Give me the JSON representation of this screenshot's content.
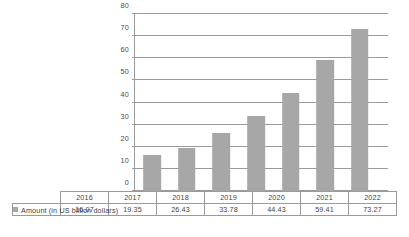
{
  "chart_data": {
    "type": "bar",
    "title": "",
    "subtitle": "",
    "xlabel": "",
    "ylabel": "",
    "categories": [
      "2016",
      "2017",
      "2018",
      "2019",
      "2020",
      "2021",
      "2022"
    ],
    "series": [
      {
        "name": "Amount (in US billion dollars)",
        "values": [
          16.07,
          19.35,
          26.43,
          33.78,
          44.43,
          59.41,
          73.27
        ]
      }
    ],
    "value_labels": [
      "16.07",
      "19.35",
      "26.43",
      "33.78",
      "44.43",
      "59.41",
      "73.27"
    ],
    "ylim": [
      0,
      80
    ],
    "yticks": [
      0,
      10,
      20,
      30,
      40,
      50,
      60,
      70,
      80
    ],
    "ytick_labels": [
      "0",
      "10",
      "20",
      "30",
      "40",
      "50",
      "60",
      "70",
      "80"
    ],
    "grid": "horizontal",
    "legend_position": "data-table-row",
    "bar_color": "#a7a7a7",
    "axis_color": "#9a9a9a",
    "text_color": "#3f3f3f"
  },
  "legend": {
    "swatch_color": "#a7a7a7",
    "label": "Amount (in US billion dollars)"
  },
  "table": {
    "header_row": [
      "2016",
      "2017",
      "2018",
      "2019",
      "2020",
      "2021",
      "2022"
    ],
    "value_row": [
      "16.07",
      "19.35",
      "26.43",
      "33.78",
      "44.43",
      "59.41",
      "73.27"
    ]
  }
}
